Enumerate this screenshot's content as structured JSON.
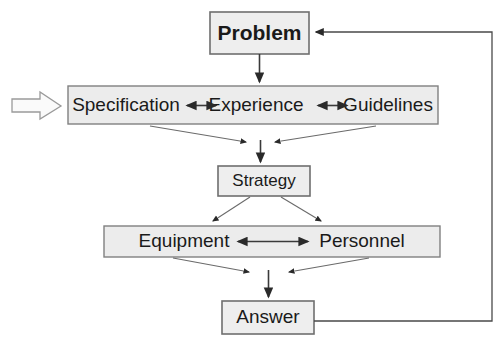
{
  "diagram": {
    "background_color": "#ffffff",
    "box_fill_color": "#eeeeee",
    "box_border_color": "#6e6e6e",
    "connector_color": "#3a3a3a",
    "input_arrow": {
      "name": "input-arrow",
      "label": ""
    },
    "nodes": [
      {
        "id": "problem",
        "label": "Problem",
        "x": 210,
        "y": 12,
        "w": 99,
        "h": 42
      },
      {
        "id": "band-middle",
        "label": "",
        "x": 68,
        "y": 86,
        "w": 370,
        "h": 38
      },
      {
        "id": "specification",
        "label": "Specification",
        "cx": 126,
        "cy": 105
      },
      {
        "id": "experience",
        "label": "Experience",
        "cx": 256,
        "cy": 105
      },
      {
        "id": "guidelines",
        "label": "Guidelines",
        "cx": 388,
        "cy": 105
      },
      {
        "id": "strategy",
        "label": "Strategy",
        "x": 218,
        "y": 166,
        "w": 92,
        "h": 30
      },
      {
        "id": "band-lower",
        "label": "",
        "x": 104,
        "y": 226,
        "w": 336,
        "h": 31
      },
      {
        "id": "equipment",
        "label": "Equipment",
        "cx": 184,
        "cy": 241
      },
      {
        "id": "personnel",
        "label": "Personnel",
        "cx": 362,
        "cy": 241
      },
      {
        "id": "answer",
        "label": "Answer",
        "x": 222,
        "y": 301,
        "w": 92,
        "h": 33
      }
    ],
    "edges": [
      {
        "id": "problem-to-band",
        "from": "problem",
        "to": "band-middle",
        "type": "arrow-down"
      },
      {
        "id": "spec-experience",
        "from": "specification",
        "to": "experience",
        "type": "double-arrow"
      },
      {
        "id": "experience-guidelines",
        "from": "experience",
        "to": "guidelines",
        "type": "double-arrow"
      },
      {
        "id": "band-to-strategy-left",
        "from": "band-middle",
        "to": "strategy",
        "type": "converge"
      },
      {
        "id": "band-to-strategy-right",
        "from": "band-middle",
        "to": "strategy",
        "type": "converge"
      },
      {
        "id": "converge-to-strategy",
        "from": "band-middle",
        "to": "strategy",
        "type": "arrow-down"
      },
      {
        "id": "strategy-to-equipment",
        "from": "strategy",
        "to": "equipment",
        "type": "diverge"
      },
      {
        "id": "strategy-to-personnel",
        "from": "strategy",
        "to": "personnel",
        "type": "diverge"
      },
      {
        "id": "equipment-personnel",
        "from": "equipment",
        "to": "personnel",
        "type": "double-arrow"
      },
      {
        "id": "band-to-answer-left",
        "from": "equipment",
        "to": "answer",
        "type": "converge"
      },
      {
        "id": "band-to-answer-right",
        "from": "personnel",
        "to": "answer",
        "type": "converge"
      },
      {
        "id": "converge-to-answer",
        "from": "band-lower",
        "to": "answer",
        "type": "arrow-down"
      },
      {
        "id": "answer-feedback-loop",
        "from": "answer",
        "to": "problem",
        "type": "feedback-loop"
      }
    ]
  }
}
